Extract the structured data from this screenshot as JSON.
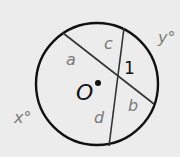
{
  "diagram": {
    "type": "circle-intersecting-chords",
    "circle": {
      "center_label": "O",
      "cx": 97,
      "cy": 84,
      "r": 61
    },
    "chords": [
      {
        "name": "chord-ab",
        "x1": 63,
        "y1": 33,
        "x2": 154,
        "y2": 104,
        "segments": [
          "a",
          "b"
        ]
      },
      {
        "name": "chord-cd",
        "x1": 124,
        "y1": 28,
        "x2": 109,
        "y2": 146,
        "segments": [
          "c",
          "d"
        ]
      }
    ],
    "intersection": {
      "x": 117,
      "y": 75
    },
    "labels": {
      "segment_a": "a",
      "segment_b": "b",
      "segment_c": "c",
      "segment_d": "d",
      "angle_1": "1",
      "center": "O",
      "arc_x": "x°",
      "arc_y": "y°"
    },
    "colors": {
      "stroke": "#111111",
      "chord": "#333333",
      "label_gray": "#7a7a7a",
      "background": "#ececec"
    }
  }
}
